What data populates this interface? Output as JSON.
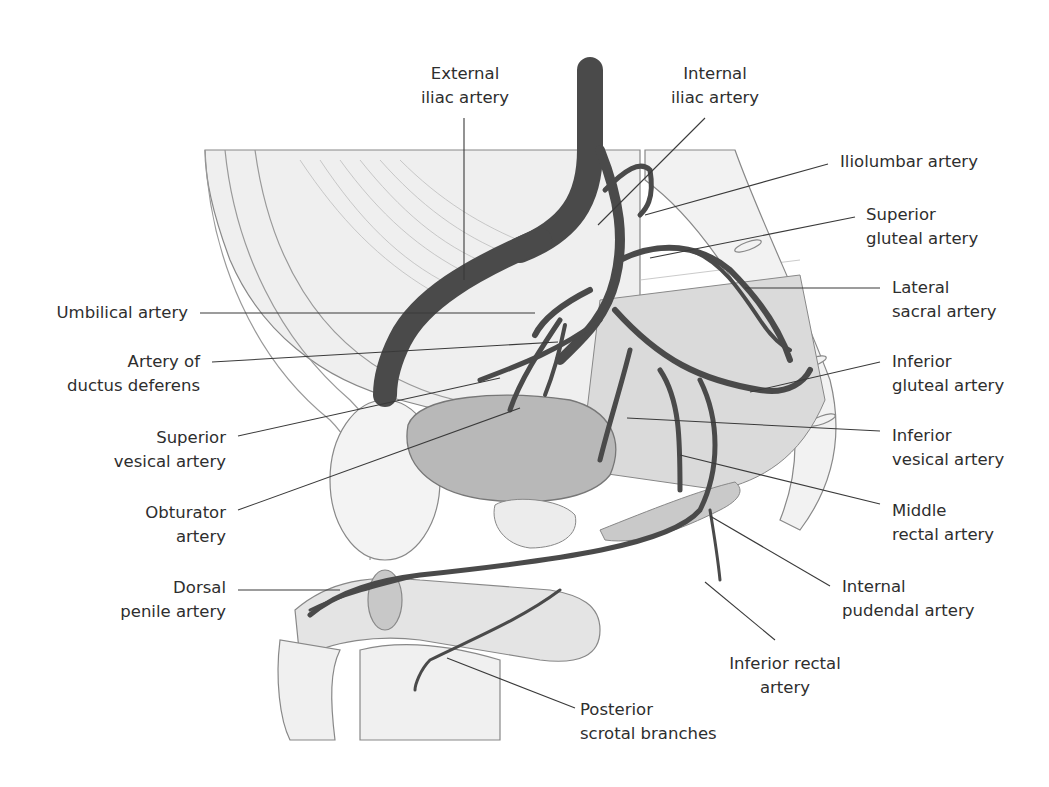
{
  "figure": {
    "colors": {
      "artery": "#4a4a4a",
      "bladder": "#b8b8b8",
      "soft_tissue": "#e6e6e6",
      "bone": "#f0f0f0",
      "outline": "#777777",
      "leader_line": "#3a3a3a",
      "label_text": "#2e2e2e"
    }
  },
  "labels": {
    "external_iliac": {
      "line1": "External",
      "line2": "iliac artery"
    },
    "internal_iliac": {
      "line1": "Internal",
      "line2": "iliac artery"
    },
    "iliolumbar": {
      "line1": "Iliolumbar artery"
    },
    "superior_gluteal": {
      "line1": "Superior",
      "line2": "gluteal artery"
    },
    "lateral_sacral": {
      "line1": "Lateral",
      "line2": "sacral artery"
    },
    "inferior_gluteal": {
      "line1": "Inferior",
      "line2": "gluteal artery"
    },
    "inferior_vesical": {
      "line1": "Inferior",
      "line2": "vesical artery"
    },
    "middle_rectal": {
      "line1": "Middle",
      "line2": "rectal artery"
    },
    "internal_pudendal": {
      "line1": "Internal",
      "line2": "pudendal artery"
    },
    "inferior_rectal": {
      "line1": "Inferior rectal",
      "line2": "artery"
    },
    "posterior_scrotal": {
      "line1": "Posterior",
      "line2": "scrotal branches"
    },
    "umbilical": {
      "line1": "Umbilical artery"
    },
    "ductus_deferens": {
      "line1": "Artery of",
      "line2": "ductus deferens"
    },
    "superior_vesical": {
      "line1": "Superior",
      "line2": "vesical artery"
    },
    "obturator": {
      "line1": "Obturator",
      "line2": "artery"
    },
    "dorsal_penile": {
      "line1": "Dorsal",
      "line2": "penile artery"
    }
  }
}
